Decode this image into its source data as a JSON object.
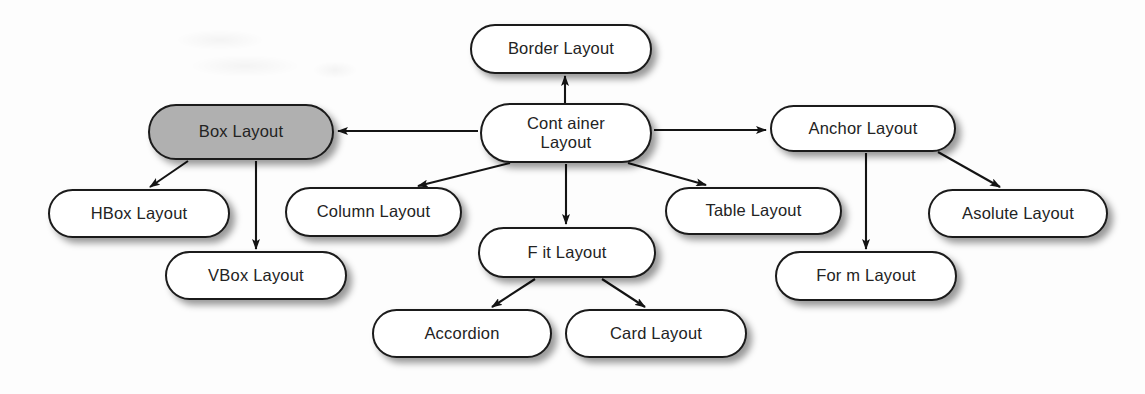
{
  "diagram": {
    "background_color": "#fdfdfd",
    "node_fill": "#ffffff",
    "node_highlight_fill": "#b0b0b0",
    "node_stroke": "#1b1b1b",
    "text_color": "#232323",
    "nodes": [
      {
        "id": "border-layout",
        "label": "Border Layout",
        "x": 470,
        "y": 24,
        "w": 182,
        "h": 50,
        "highlighted": false
      },
      {
        "id": "container-layout",
        "label": "Cont ainer\nLayout",
        "x": 480,
        "y": 103,
        "w": 172,
        "h": 60,
        "highlighted": false
      },
      {
        "id": "box-layout",
        "label": "Box Layout",
        "x": 148,
        "y": 104,
        "w": 186,
        "h": 56,
        "highlighted": true
      },
      {
        "id": "anchor-layout",
        "label": "Anchor Layout",
        "x": 770,
        "y": 105,
        "w": 186,
        "h": 47,
        "highlighted": false
      },
      {
        "id": "hbox-layout",
        "label": "HBox Layout",
        "x": 48,
        "y": 189,
        "w": 182,
        "h": 49,
        "highlighted": false
      },
      {
        "id": "column-layout",
        "label": "Column Layout",
        "x": 285,
        "y": 187,
        "w": 177,
        "h": 50,
        "highlighted": false
      },
      {
        "id": "table-layout",
        "label": "Table Layout",
        "x": 665,
        "y": 187,
        "w": 177,
        "h": 48,
        "highlighted": false
      },
      {
        "id": "asolute-layout",
        "label": "Asolute Layout",
        "x": 928,
        "y": 189,
        "w": 180,
        "h": 49,
        "highlighted": false
      },
      {
        "id": "vbox-layout",
        "label": "VBox Layout",
        "x": 165,
        "y": 251,
        "w": 182,
        "h": 49,
        "highlighted": false
      },
      {
        "id": "fit-layout",
        "label": "F it Layout",
        "x": 478,
        "y": 227,
        "w": 178,
        "h": 51,
        "highlighted": false
      },
      {
        "id": "form-layout",
        "label": "For m Layout",
        "x": 775,
        "y": 251,
        "w": 182,
        "h": 50,
        "highlighted": false
      },
      {
        "id": "accordion",
        "label": "Accordion",
        "x": 372,
        "y": 309,
        "w": 180,
        "h": 49,
        "highlighted": false
      },
      {
        "id": "card-layout",
        "label": "Card Layout",
        "x": 565,
        "y": 309,
        "w": 182,
        "h": 49,
        "highlighted": false
      }
    ],
    "edges": [
      {
        "id": "container-to-border",
        "from": "container-layout",
        "to": "border-layout",
        "x1": 565,
        "y1": 103,
        "x2": 565,
        "y2": 76
      },
      {
        "id": "container-to-box",
        "from": "container-layout",
        "to": "box-layout",
        "x1": 478,
        "y1": 131,
        "x2": 338,
        "y2": 131
      },
      {
        "id": "container-to-anchor",
        "from": "container-layout",
        "to": "anchor-layout",
        "x1": 654,
        "y1": 130,
        "x2": 766,
        "y2": 130
      },
      {
        "id": "container-to-column",
        "from": "container-layout",
        "to": "column-layout",
        "x1": 510,
        "y1": 163,
        "x2": 418,
        "y2": 186
      },
      {
        "id": "container-to-fit",
        "from": "container-layout",
        "to": "fit-layout",
        "x1": 566,
        "y1": 164,
        "x2": 566,
        "y2": 224
      },
      {
        "id": "container-to-table",
        "from": "container-layout",
        "to": "table-layout",
        "x1": 628,
        "y1": 163,
        "x2": 706,
        "y2": 185
      },
      {
        "id": "box-to-hbox",
        "from": "box-layout",
        "to": "hbox-layout",
        "x1": 188,
        "y1": 161,
        "x2": 150,
        "y2": 187
      },
      {
        "id": "box-to-vbox",
        "from": "box-layout",
        "to": "vbox-layout",
        "x1": 256,
        "y1": 161,
        "x2": 256,
        "y2": 249
      },
      {
        "id": "anchor-to-form",
        "from": "anchor-layout",
        "to": "form-layout",
        "x1": 866,
        "y1": 153,
        "x2": 866,
        "y2": 249
      },
      {
        "id": "anchor-to-asolute",
        "from": "anchor-layout",
        "to": "asolute-layout",
        "x1": 938,
        "y1": 152,
        "x2": 1000,
        "y2": 187
      },
      {
        "id": "fit-to-accordion",
        "from": "fit-layout",
        "to": "accordion",
        "x1": 535,
        "y1": 279,
        "x2": 492,
        "y2": 307
      },
      {
        "id": "fit-to-card",
        "from": "fit-layout",
        "to": "card-layout",
        "x1": 602,
        "y1": 279,
        "x2": 645,
        "y2": 307
      }
    ]
  }
}
